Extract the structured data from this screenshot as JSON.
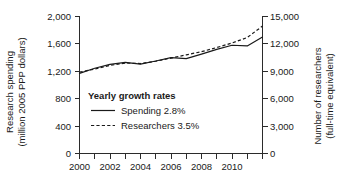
{
  "chart_data": {
    "type": "line",
    "title": "",
    "xlabel": "",
    "x": [
      2000,
      2001,
      2002,
      2003,
      2004,
      2005,
      2006,
      2007,
      2008,
      2009,
      2010,
      2011,
      2012
    ],
    "xlim": [
      2000,
      2012
    ],
    "xticklabels": [
      "2000",
      "2002",
      "2004",
      "2006",
      "2008",
      "2010"
    ],
    "xtick_values": [
      2000,
      2002,
      2004,
      2006,
      2008,
      2010
    ],
    "grid": false,
    "legend_position": "center-left-inside",
    "axes": [
      {
        "id": "left",
        "label_line1": "Research spending",
        "label_line2": "(million 2005 PPP dollars)",
        "ticklabels": [
          "0",
          "400",
          "800",
          "1,200",
          "1,600",
          "2,000"
        ],
        "tick_values": [
          0,
          400,
          800,
          1200,
          1600,
          2000
        ],
        "ylim": [
          0,
          2000
        ]
      },
      {
        "id": "right",
        "label_line1": "Number of researchers",
        "label_line2": "(full-time equivalent)",
        "ticklabels": [
          "0",
          "3,000",
          "6,000",
          "9,000",
          "12,000",
          "15,000"
        ],
        "tick_values": [
          0,
          3000,
          6000,
          9000,
          12000,
          15000
        ],
        "ylim": [
          0,
          15000
        ]
      }
    ],
    "series": [
      {
        "name": "Spending",
        "axis": "left",
        "style": "solid",
        "legend_label": "Spending 2.8%",
        "growth_rate": "2.8%",
        "values": [
          1170,
          1245,
          1300,
          1330,
          1305,
          1350,
          1400,
          1385,
          1450,
          1520,
          1580,
          1570,
          1700
        ]
      },
      {
        "name": "Researchers",
        "axis": "right",
        "style": "dashed",
        "legend_label": "Researchers 3.5%",
        "growth_rate": "3.5%",
        "values": [
          8900,
          9250,
          9650,
          9900,
          9850,
          10100,
          10450,
          10800,
          11150,
          11600,
          12100,
          12700,
          13950
        ]
      }
    ]
  },
  "legend": {
    "title": "Yearly growth rates",
    "entries": [
      {
        "label": "Spending 2.8%",
        "style": "solid"
      },
      {
        "label": "Researchers 3.5%",
        "style": "dashed"
      }
    ]
  }
}
